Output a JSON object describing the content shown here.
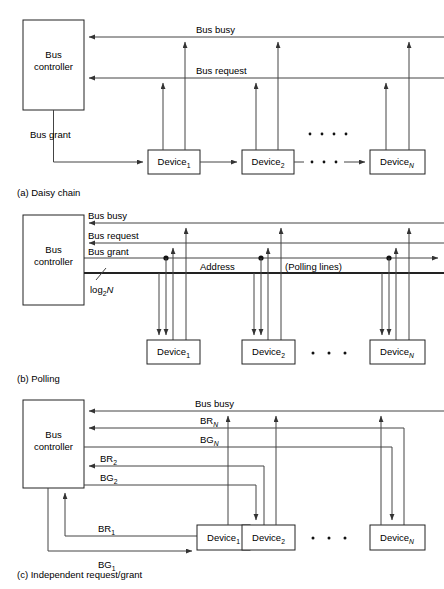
{
  "figure": {
    "title_implicit": "Bus arbitration schemes",
    "background": "#ffffff",
    "line_color": "#444444",
    "box_stroke": "#222222"
  },
  "labels": {
    "bus_controller_line1": "Bus",
    "bus_controller_line2": "controller",
    "device": "Device",
    "sub_1": "1",
    "sub_2": "2",
    "sub_N": "N",
    "bus_busy": "Bus busy",
    "bus_request": "Bus request",
    "bus_grant": "Bus grant",
    "address": "Address",
    "polling_lines": "(Polling lines)",
    "log2": "log",
    "log2_sub": "2",
    "log2_n": "N",
    "br": "BR",
    "bg": "BG",
    "ellipsis": "• • •"
  },
  "panels": [
    {
      "id": "a",
      "caption": "(a) Daisy chain",
      "controller": {
        "line1": "Bus",
        "line2": "controller"
      },
      "devices": [
        {
          "label": "Device",
          "sub": "1"
        },
        {
          "label": "Device",
          "sub": "2"
        },
        {
          "label": "Device",
          "sub": "N"
        }
      ],
      "signals": [
        {
          "name": "Bus busy",
          "direction": "to-controller"
        },
        {
          "name": "Bus request",
          "direction": "to-controller"
        },
        {
          "name": "Bus grant",
          "direction": "from-controller-chained"
        }
      ]
    },
    {
      "id": "b",
      "caption": "(b) Polling",
      "controller": {
        "line1": "Bus",
        "line2": "controller"
      },
      "devices": [
        {
          "label": "Device",
          "sub": "1"
        },
        {
          "label": "Device",
          "sub": "2"
        },
        {
          "label": "Device",
          "sub": "N"
        }
      ],
      "signals": [
        {
          "name": "Bus busy",
          "direction": "to-controller"
        },
        {
          "name": "Bus request",
          "direction": "to-controller"
        },
        {
          "name": "Bus grant",
          "direction": "from-controller"
        },
        {
          "name": "Address",
          "direction": "from-controller",
          "note": "(Polling lines)",
          "width_label": "log2N"
        }
      ]
    },
    {
      "id": "c",
      "caption": "(c) Independent request/grant",
      "controller": {
        "line1": "Bus",
        "line2": "controller"
      },
      "devices": [
        {
          "label": "Device",
          "sub": "1"
        },
        {
          "label": "Device",
          "sub": "2"
        },
        {
          "label": "Device",
          "sub": "N"
        }
      ],
      "signals": [
        {
          "name": "Bus busy",
          "direction": "to-controller"
        },
        {
          "name": "BR",
          "sub": "N",
          "direction": "to-controller"
        },
        {
          "name": "BG",
          "sub": "N",
          "direction": "from-controller"
        },
        {
          "name": "BR",
          "sub": "2",
          "direction": "to-controller"
        },
        {
          "name": "BG",
          "sub": "2",
          "direction": "from-controller"
        },
        {
          "name": "BR",
          "sub": "1",
          "direction": "to-controller"
        },
        {
          "name": "BG",
          "sub": "1",
          "direction": "from-controller"
        }
      ]
    }
  ]
}
